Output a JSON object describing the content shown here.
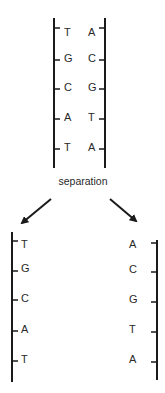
{
  "diagram": {
    "colors": {
      "ink": "#1a1a1a",
      "text": "#2a2a2a",
      "background": "#ffffff"
    },
    "double_helix": {
      "left_strand": [
        "T",
        "G",
        "C",
        "A",
        "T"
      ],
      "right_strand": [
        "A",
        "C",
        "G",
        "T",
        "A"
      ]
    },
    "process_label": "separation",
    "separated": {
      "left_strand": [
        "T",
        "G",
        "C",
        "A",
        "T"
      ],
      "right_strand": [
        "A",
        "C",
        "G",
        "T",
        "A"
      ]
    },
    "arrows": [
      {
        "name": "arrow-to-left-strand",
        "direction": "down-left"
      },
      {
        "name": "arrow-to-right-strand",
        "direction": "down-right"
      }
    ]
  }
}
